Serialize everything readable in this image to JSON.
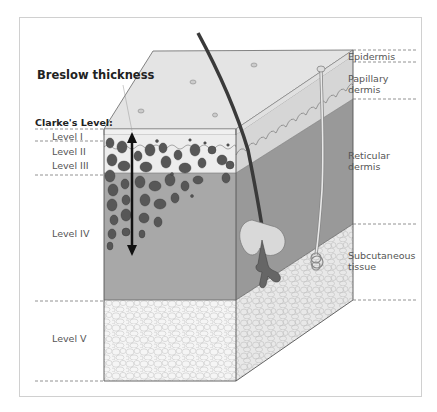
{
  "diagram": {
    "title": "Breslow thickness",
    "clarke_heading": "Clarke's Level:",
    "clarke_levels": [
      {
        "label": "Level I"
      },
      {
        "label": "Level II"
      },
      {
        "label": "Level III"
      },
      {
        "label": "Level IV"
      },
      {
        "label": "Level V"
      }
    ],
    "skin_layers": [
      {
        "label": "Epidermis"
      },
      {
        "label": "Papillary\ndermis",
        "line1": "Papillary",
        "line2": "dermis"
      },
      {
        "label": "Reticular\ndermis",
        "line1": "Reticular",
        "line2": "dermis"
      },
      {
        "label": "Subcutaneous\ntissue",
        "line1": "Subcutaneous",
        "line2": "tissue"
      }
    ],
    "colors": {
      "top_face": "#e6e6e6",
      "epidermis": "#f2f2f2",
      "papillary": "#ececec",
      "reticular": "#a9a9a9",
      "reticular_side": "#999999",
      "subcutaneous": "#f4f4f4",
      "melanoma_cells": "#555555",
      "arrow": "#111111",
      "dashed_lines": "#777777"
    }
  }
}
